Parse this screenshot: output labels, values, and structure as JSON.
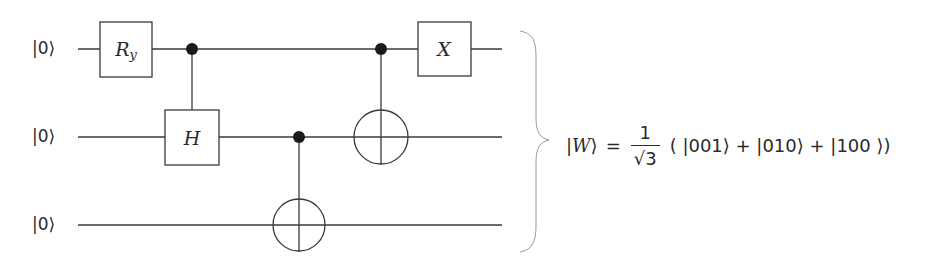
{
  "diagram": {
    "type": "quantum-circuit",
    "qubits": [
      {
        "label": "|0⟩",
        "y": 49
      },
      {
        "label": "|0⟩",
        "y": 137
      },
      {
        "label": "|0⟩",
        "y": 225
      }
    ],
    "gates": [
      {
        "type": "single",
        "name": "R",
        "subscript": "y",
        "qubit": 0
      },
      {
        "type": "controlled",
        "name": "H",
        "control": 0,
        "target": 1
      },
      {
        "type": "cnot",
        "control": 1,
        "target": 2
      },
      {
        "type": "cnot",
        "control": 0,
        "target": 1
      },
      {
        "type": "single",
        "name": "X",
        "qubit": 0
      }
    ],
    "gate_labels": {
      "ry_main": "R",
      "ry_sub": "y",
      "h": "H",
      "x": "X"
    },
    "output_state": {
      "lhs_ket_open": "|",
      "lhs_symbol": "W",
      "lhs_ket_close": "⟩",
      "equals": "=",
      "numerator": "1",
      "denominator": "√3",
      "terms": "( |001⟩ + |010⟩ + |100 ⟩)"
    },
    "colors": {
      "line": "#3a3a3a",
      "control_dot": "#1a1a1a",
      "brace": "#9a9a9a",
      "text": "#2a2a2a",
      "background": "#ffffff"
    }
  }
}
